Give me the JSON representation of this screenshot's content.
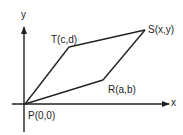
{
  "diagram": {
    "type": "parallelogram-on-axes",
    "colors": {
      "line": "#222222",
      "text": "#222222",
      "background": "#ffffff"
    },
    "axes": {
      "x_label": "x",
      "y_label": "y"
    },
    "vertices": {
      "P": {
        "label": "P(0,0)",
        "px": [
          25,
          104
        ]
      },
      "R": {
        "label": "R(a,b)",
        "px": [
          103,
          80
        ]
      },
      "S": {
        "label": "S(x,y)",
        "px": [
          145,
          30
        ]
      },
      "T": {
        "label": "T(c,d)",
        "px": [
          69,
          47
        ]
      }
    },
    "edges": [
      [
        "P",
        "R"
      ],
      [
        "R",
        "S"
      ],
      [
        "S",
        "T"
      ],
      [
        "T",
        "P"
      ]
    ]
  }
}
